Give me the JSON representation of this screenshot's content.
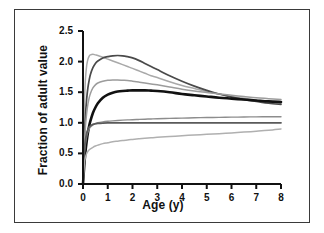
{
  "figure": {
    "background": "#ffffff",
    "border_color": "#3a3a3a"
  },
  "chart_data": {
    "type": "line",
    "title": "",
    "subtitle": "",
    "xlabel": "Age (y)",
    "ylabel": "Fraction of adult value",
    "xlim": [
      0,
      8
    ],
    "ylim": [
      0.0,
      2.5
    ],
    "xticks": [
      0,
      1,
      2,
      3,
      4,
      5,
      6,
      7,
      8
    ],
    "xticklabels": [
      "0",
      "1",
      "2",
      "3",
      "4",
      "5",
      "6",
      "7",
      "8"
    ],
    "yticks": [
      0.0,
      0.5,
      1.0,
      1.5,
      2.0,
      2.5
    ],
    "yticklabels": [
      "0.0",
      "0.5",
      "1.0",
      "1.5",
      "2.0",
      "2.5"
    ],
    "grid": false,
    "legend": "none",
    "x": [
      0,
      0.05,
      0.1,
      0.15,
      0.2,
      0.25,
      0.3,
      0.4,
      0.5,
      0.6,
      0.8,
      1.0,
      1.2,
      1.4,
      1.6,
      1.8,
      2.0,
      2.25,
      2.5,
      2.75,
      3.0,
      3.5,
      4.0,
      4.5,
      5.0,
      5.5,
      6.0,
      6.5,
      7.0,
      7.5,
      8.0
    ],
    "series": [
      {
        "name": "curve-early-peak-light",
        "color": "#a9a9a9",
        "width": 1.5,
        "peak_x": 0.35,
        "peak_y": 2.12,
        "end_y": 1.32,
        "values": [
          0.05,
          1.25,
          1.72,
          1.94,
          2.04,
          2.09,
          2.11,
          2.12,
          2.11,
          2.1,
          2.07,
          2.04,
          2.01,
          1.98,
          1.95,
          1.92,
          1.89,
          1.85,
          1.81,
          1.77,
          1.74,
          1.67,
          1.61,
          1.56,
          1.51,
          1.47,
          1.43,
          1.4,
          1.37,
          1.34,
          1.32
        ]
      },
      {
        "name": "curve-mid-peak-dark",
        "color": "#4a4a4a",
        "width": 1.7,
        "peak_x": 1.45,
        "peak_y": 2.1,
        "end_y": 1.3,
        "values": [
          0.03,
          0.7,
          1.12,
          1.4,
          1.58,
          1.7,
          1.79,
          1.9,
          1.97,
          2.01,
          2.06,
          2.08,
          2.095,
          2.1,
          2.095,
          2.08,
          2.06,
          2.02,
          1.97,
          1.92,
          1.87,
          1.77,
          1.68,
          1.6,
          1.53,
          1.47,
          1.42,
          1.38,
          1.35,
          1.32,
          1.3
        ]
      },
      {
        "name": "curve-mid-peak-light",
        "color": "#9c9c9c",
        "width": 1.5,
        "peak_x": 1.5,
        "peak_y": 1.7,
        "end_y": 1.38,
        "values": [
          0.04,
          0.62,
          0.95,
          1.16,
          1.31,
          1.41,
          1.48,
          1.57,
          1.62,
          1.65,
          1.68,
          1.695,
          1.7,
          1.7,
          1.695,
          1.69,
          1.68,
          1.665,
          1.65,
          1.635,
          1.62,
          1.585,
          1.55,
          1.52,
          1.495,
          1.47,
          1.45,
          1.43,
          1.41,
          1.395,
          1.38
        ]
      },
      {
        "name": "curve-plateau-black-bold",
        "color": "#111111",
        "width": 2.6,
        "peak_x": 2.6,
        "peak_y": 1.53,
        "end_y": 1.34,
        "values": [
          0.0,
          0.3,
          0.53,
          0.7,
          0.84,
          0.95,
          1.03,
          1.16,
          1.25,
          1.32,
          1.41,
          1.46,
          1.49,
          1.51,
          1.52,
          1.525,
          1.53,
          1.53,
          1.53,
          1.525,
          1.52,
          1.5,
          1.47,
          1.45,
          1.43,
          1.41,
          1.395,
          1.38,
          1.365,
          1.35,
          1.34
        ]
      },
      {
        "name": "curve-rise-to-1-1",
        "color": "#8d8d8d",
        "width": 1.4,
        "peak_x": 8.0,
        "peak_y": 1.1,
        "end_y": 1.1,
        "values": [
          0.02,
          0.46,
          0.66,
          0.78,
          0.85,
          0.9,
          0.93,
          0.965,
          0.985,
          1.0,
          1.015,
          1.025,
          1.032,
          1.038,
          1.043,
          1.047,
          1.05,
          1.055,
          1.059,
          1.063,
          1.066,
          1.072,
          1.077,
          1.082,
          1.086,
          1.089,
          1.092,
          1.095,
          1.097,
          1.099,
          1.1
        ]
      },
      {
        "name": "curve-flat-at-1-0",
        "color": "#5a5a5a",
        "width": 1.8,
        "peak_x": 8.0,
        "peak_y": 1.0,
        "end_y": 1.0,
        "values": [
          0.02,
          0.52,
          0.72,
          0.83,
          0.89,
          0.93,
          0.95,
          0.975,
          0.985,
          0.99,
          0.995,
          0.998,
          0.999,
          1.0,
          1.0,
          1.0,
          1.0,
          1.0,
          1.0,
          1.0,
          1.0,
          1.0,
          1.0,
          1.0,
          1.0,
          1.0,
          1.0,
          1.0,
          1.0,
          1.0,
          1.0
        ]
      },
      {
        "name": "curve-rise-to-0-9",
        "color": "#b0b0b0",
        "width": 1.5,
        "peak_x": 8.0,
        "peak_y": 0.9,
        "end_y": 0.9,
        "values": [
          0.0,
          0.32,
          0.44,
          0.5,
          0.535,
          0.56,
          0.575,
          0.6,
          0.62,
          0.635,
          0.66,
          0.675,
          0.69,
          0.7,
          0.71,
          0.72,
          0.728,
          0.738,
          0.747,
          0.755,
          0.762,
          0.776,
          0.789,
          0.8,
          0.812,
          0.823,
          0.835,
          0.848,
          0.862,
          0.878,
          0.9
        ]
      }
    ]
  }
}
